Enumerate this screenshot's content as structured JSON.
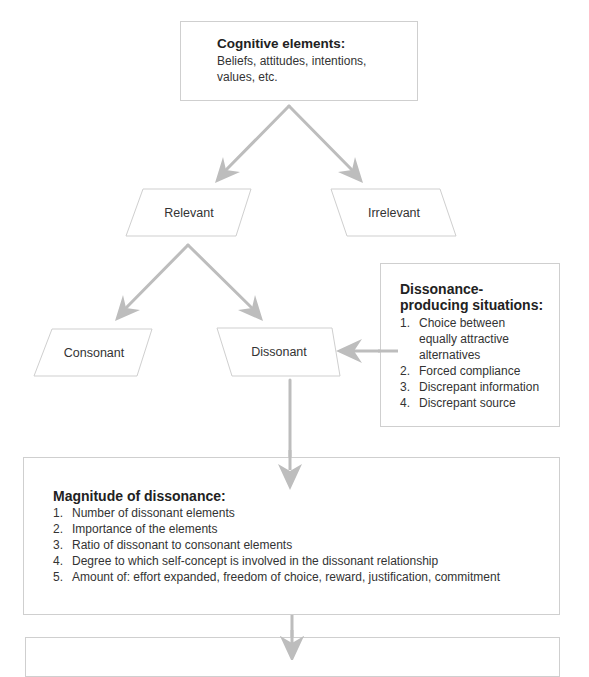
{
  "cognitive_elements": {
    "title": "Cognitive elements:",
    "line1": "Beliefs, attitudes, intentions,",
    "line2": "values, etc."
  },
  "nodes": {
    "relevant": "Relevant",
    "irrelevant": "Irrelevant",
    "consonant": "Consonant",
    "dissonant": "Dissonant"
  },
  "dissonance_producing": {
    "title_line1": "Dissonance-",
    "title_line2": "producing situations:",
    "items": [
      {
        "num": "1.",
        "text": "Choice between equally attractive alternatives"
      },
      {
        "num": "2.",
        "text": "Forced compliance"
      },
      {
        "num": "3.",
        "text": "Discrepant information"
      },
      {
        "num": "4.",
        "text": "Discrepant source"
      }
    ]
  },
  "magnitude": {
    "title": "Magnitude of dissonance:",
    "items": [
      {
        "num": "1.",
        "text": "Number of dissonant elements"
      },
      {
        "num": "2.",
        "text": "Importance of the elements"
      },
      {
        "num": "3.",
        "text": "Ratio of dissonant to consonant elements"
      },
      {
        "num": "4.",
        "text": "Degree to which self-concept is involved in the dissonant relationship"
      },
      {
        "num": "5.",
        "text": "Amount of: effort expanded, freedom of choice, reward, justification, commitment"
      }
    ]
  },
  "colors": {
    "arrow": "#bdbdbd",
    "border": "#cfcfcf",
    "text": "#2a2a2a"
  }
}
